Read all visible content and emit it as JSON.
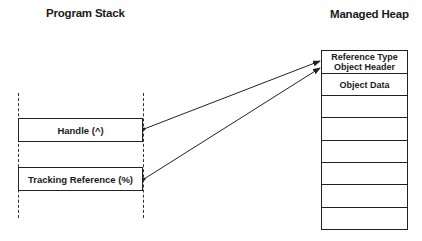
{
  "diagram": {
    "stack": {
      "title": "Program Stack",
      "boxes": [
        {
          "label": "Handle (^)"
        },
        {
          "label": "Tracking Reference (%)"
        }
      ]
    },
    "heap": {
      "title": "Managed Heap",
      "rows": [
        {
          "label": "Reference Type Object Header"
        },
        {
          "label": "Object Data"
        },
        {
          "label": ""
        },
        {
          "label": ""
        },
        {
          "label": ""
        },
        {
          "label": ""
        },
        {
          "label": ""
        },
        {
          "label": ""
        }
      ]
    },
    "arrows": [
      {
        "from": "Handle (^)",
        "to": "Reference Type Object Header"
      },
      {
        "from": "Tracking Reference (%)",
        "to": "Reference Type Object Header"
      }
    ]
  }
}
